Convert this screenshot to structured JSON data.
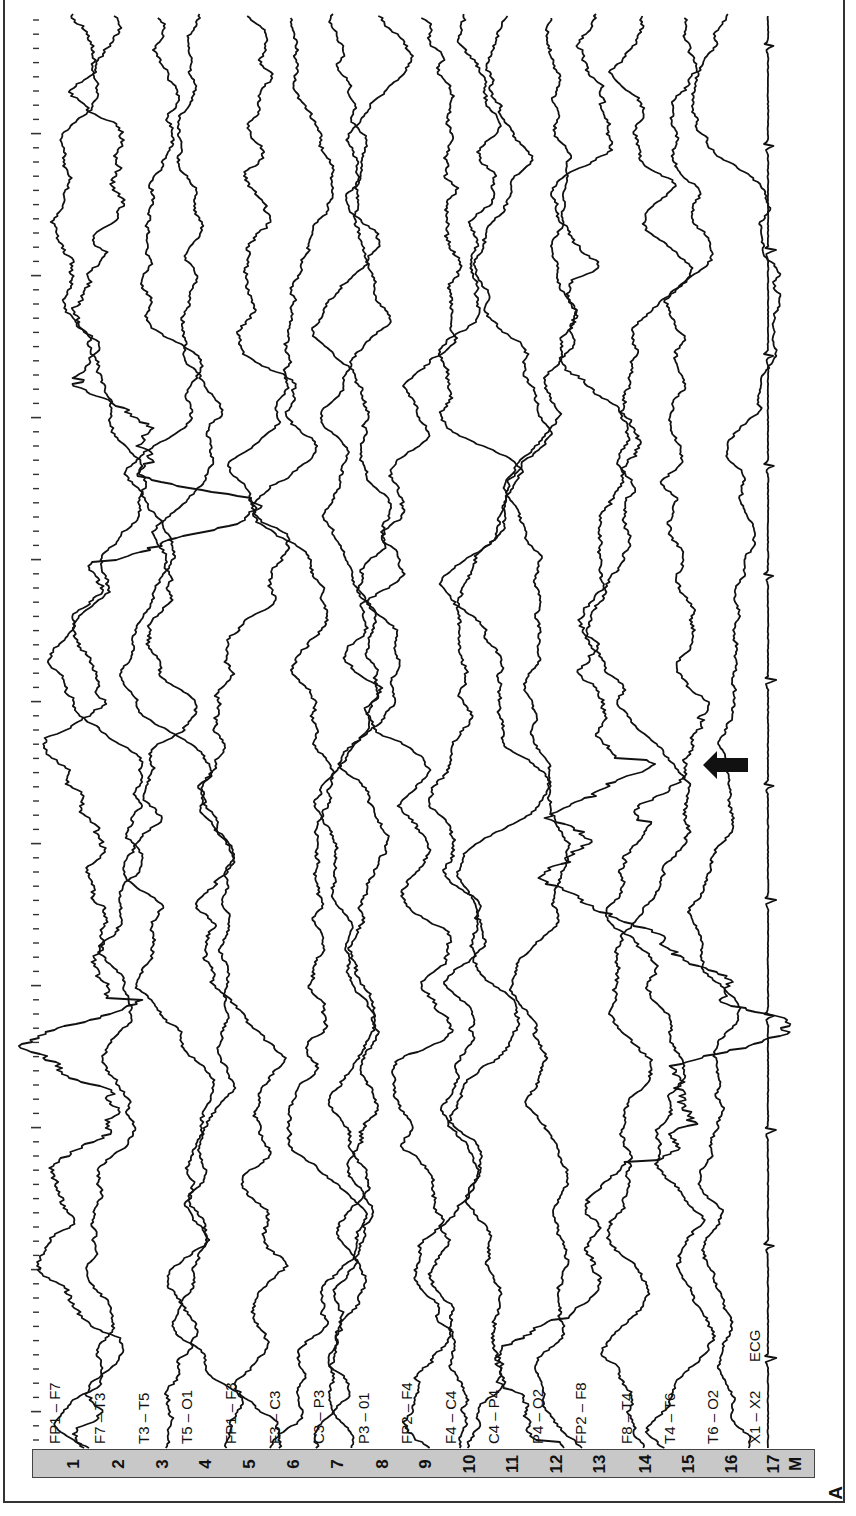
{
  "figure": {
    "panel_letter": "A",
    "montage_marker": "M",
    "orientation": "rotated-90-ccw",
    "trace_color": "#111111",
    "bar_color": "#c8c8c8",
    "arrow_color": "#111111"
  },
  "time_axis": {
    "x": 36,
    "start_y": 20,
    "tick_spacing": 14.2,
    "major_every": 10,
    "first_major_index": 8,
    "end_y": 1440
  },
  "channels": [
    {
      "num": "1",
      "label": "FP1 – F7",
      "x": 68,
      "amp": 9,
      "seed": 11,
      "burst": [
        [
          380,
          560,
          2.0
        ],
        [
          1000,
          1160,
          1.8
        ]
      ]
    },
    {
      "num": "2",
      "label": "F7 – T3",
      "x": 113,
      "amp": 6,
      "seed": 23,
      "burst": []
    },
    {
      "num": "3",
      "label": "T3 – T5",
      "x": 157,
      "amp": 6,
      "seed": 37,
      "burst": []
    },
    {
      "num": "4",
      "label": "T5 – O1",
      "x": 200,
      "amp": 5,
      "seed": 41,
      "burst": []
    },
    {
      "num": "5",
      "label": "FP1 – F3",
      "x": 244,
      "amp": 7,
      "seed": 53,
      "burst": []
    },
    {
      "num": "6",
      "label": "F3 – C3",
      "x": 288,
      "amp": 6,
      "seed": 67,
      "burst": []
    },
    {
      "num": "7",
      "label": "C3 – P3",
      "x": 332,
      "amp": 5,
      "seed": 71,
      "burst": []
    },
    {
      "num": "8",
      "label": "P3 – 01",
      "x": 377,
      "amp": 6,
      "seed": 83,
      "burst": []
    },
    {
      "num": "9",
      "label": "FP2 – F4",
      "x": 420,
      "amp": 7,
      "seed": 97,
      "burst": []
    },
    {
      "num": "10",
      "label": "F4 – C4",
      "x": 464,
      "amp": 6,
      "seed": 101,
      "burst": []
    },
    {
      "num": "11",
      "label": "C4 – P4",
      "x": 507,
      "amp": 6,
      "seed": 113,
      "burst": []
    },
    {
      "num": "12",
      "label": "P4 – O2",
      "x": 551,
      "amp": 5,
      "seed": 127,
      "burst": []
    },
    {
      "num": "13",
      "label": "FP2 – F8",
      "x": 594,
      "amp": 8,
      "seed": 131,
      "burst": [
        [
          760,
          1160,
          2.2
        ],
        [
          1320,
          1440,
          1.6
        ]
      ]
    },
    {
      "num": "14",
      "label": "F8 – T4",
      "x": 640,
      "amp": 6,
      "seed": 149,
      "burst": []
    },
    {
      "num": "15",
      "label": "T4 – T6",
      "x": 683,
      "amp": 6,
      "seed": 151,
      "burst": [
        [
          720,
          820,
          1.5
        ]
      ]
    },
    {
      "num": "16",
      "label": "T6 – O2",
      "x": 726,
      "amp": 5,
      "seed": 163,
      "burst": []
    },
    {
      "num": "17",
      "label": "X1 – X2",
      "x": 768,
      "amp": 0.8,
      "seed": 173,
      "burst": [],
      "extra_label": "ECG",
      "ecg": true
    }
  ],
  "ecg_spikes_y": [
    45,
    145,
    250,
    355,
    465,
    575,
    680,
    785,
    900,
    1015,
    1130,
    1245,
    1358
  ],
  "arrow": {
    "x": 703,
    "y": 765,
    "direction": "left",
    "points_to_channel": "15"
  },
  "trace_span": {
    "top": 14,
    "bottom": 1448
  }
}
